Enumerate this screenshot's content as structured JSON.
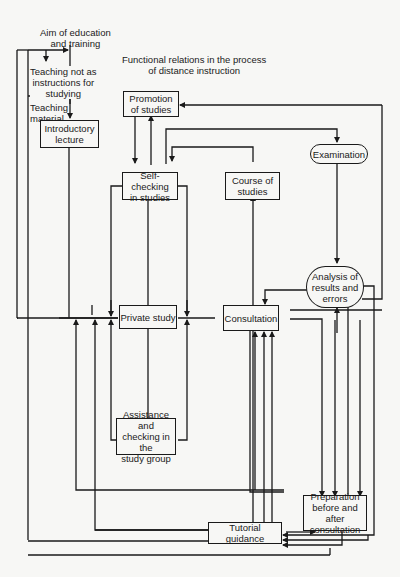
{
  "title": {
    "line1": "Functional relations in the process",
    "line2": "of distance instruction"
  },
  "labels": {
    "aim_line1": "Aim of education",
    "aim_line2": "and training",
    "teaching_not_line1": "Teaching not as",
    "teaching_not_line2": "instructions for",
    "teaching_not_line3": "studying",
    "teaching_material_line1": "Teaching",
    "teaching_material_line2": "material"
  },
  "nodes": {
    "introductory_lecture": {
      "line1": "Introductory",
      "line2": "lecture"
    },
    "promotion_of_studies": {
      "line1": "Promotion",
      "line2": "of studies"
    },
    "self_checking": {
      "line1": "Self-checking",
      "line2": "in studies"
    },
    "course_of_studies": {
      "line1": "Course of",
      "line2": "studies"
    },
    "examination": {
      "line1": "Examination"
    },
    "analysis": {
      "line1": "Analysis of",
      "line2": "results and",
      "line3": "errors"
    },
    "private_study": {
      "line1": "Private study"
    },
    "consultation": {
      "line1": "Consultation"
    },
    "assistance": {
      "line1": "Assistance and",
      "line2": "checking in the",
      "line3": "study group"
    },
    "preparation": {
      "line1": "Preparation",
      "line2": "before and after",
      "line3": "consultation"
    },
    "tutorial_guidance": {
      "line1": "Tutorial guidance"
    }
  },
  "colors": {
    "line": "#1a1a1a",
    "background": "#f7f7f5"
  }
}
